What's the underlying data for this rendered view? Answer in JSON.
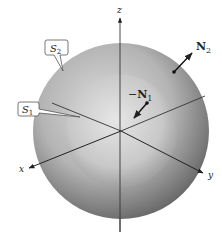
{
  "figure": {
    "type": "concentric-spheres",
    "axes": {
      "z_label": "z",
      "x_label": "x",
      "y_label": "y"
    },
    "surfaces": [
      {
        "id": "S1",
        "label_main": "S",
        "label_sub": "1",
        "role": "inner sphere"
      },
      {
        "id": "S2",
        "label_main": "S",
        "label_sub": "2",
        "role": "outer sphere"
      }
    ],
    "normals": [
      {
        "id": "N1",
        "label_main": "N",
        "label_sub": "1",
        "direction": "inward",
        "sign": "−"
      },
      {
        "id": "N2",
        "label_main": "N",
        "label_sub": "2",
        "direction": "outward",
        "sign": ""
      }
    ],
    "colors": {
      "outer_light": "#d8d8d8",
      "outer_dark": "#6e6e6e",
      "inner_light": "#e2e2e2",
      "inner_dark": "#9a9a9a",
      "axis": "#333333",
      "label_box": "#ffffff"
    }
  }
}
